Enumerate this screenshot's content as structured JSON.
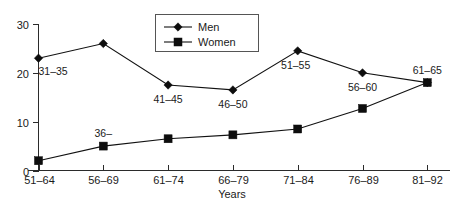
{
  "chart_data": {
    "type": "line",
    "title": "",
    "xlabel": "Years",
    "ylabel": "",
    "categories": [
      "51–64",
      "56–69",
      "61–74",
      "66–79",
      "71–84",
      "76–89",
      "81–92"
    ],
    "ylim": [
      0,
      30
    ],
    "yticks": [
      0,
      10,
      20,
      30
    ],
    "ytick_labels": [
      "0",
      "10",
      "20",
      "30"
    ],
    "grid": false,
    "legend_position": "top-center",
    "series": [
      {
        "name": "Men",
        "marker": "diamond",
        "values": [
          23,
          26,
          17.5,
          16.5,
          24.5,
          20,
          18
        ],
        "point_labels": [
          "31–35",
          "",
          "41–45",
          "46–50",
          "51–55",
          "56–60",
          "61–65"
        ]
      },
      {
        "name": "Women",
        "marker": "square",
        "values": [
          2,
          5,
          6.5,
          7.3,
          8.5,
          12.7,
          18
        ],
        "point_labels": [
          "",
          "36–",
          "",
          "",
          "",
          "",
          ""
        ]
      }
    ],
    "legend_entries": [
      {
        "label": "Men",
        "marker": "diamond"
      },
      {
        "label": "Women",
        "marker": "square"
      }
    ]
  },
  "colors": {
    "series": "#111111",
    "axis": "#2b2b2b",
    "text": "#1a1a1a",
    "background": "#ffffff",
    "legend_border": "#555555"
  }
}
